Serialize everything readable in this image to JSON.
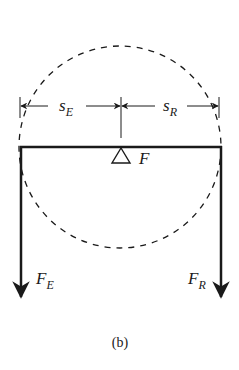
{
  "figure": {
    "caption": "(b)",
    "labels": {
      "s_E": {
        "main": "s",
        "sub": "E"
      },
      "s_R": {
        "main": "s",
        "sub": "R"
      },
      "fulcrum": {
        "main": "F"
      },
      "F_E": {
        "main": "F",
        "sub": "E"
      },
      "F_R": {
        "main": "F",
        "sub": "R"
      }
    },
    "colors": {
      "ink": "#1a1a1a",
      "background": "#ffffff"
    }
  }
}
